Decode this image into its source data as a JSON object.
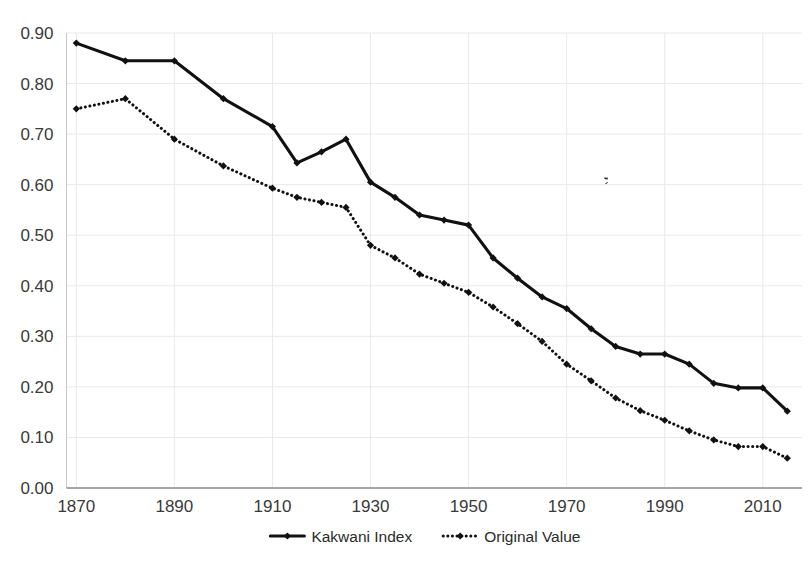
{
  "chart_data": {
    "type": "line",
    "title": "",
    "subtitle": "",
    "xlabel": "",
    "ylabel": "",
    "xlim": [
      1868,
      2018
    ],
    "ylim": [
      0.0,
      0.9
    ],
    "grid": true,
    "legend_position": "bottom-center",
    "x_tick_labels": [
      "1870",
      "1890",
      "1910",
      "1930",
      "1950",
      "1970",
      "1990",
      "2010"
    ],
    "x_ticks": [
      1870,
      1890,
      1910,
      1930,
      1950,
      1970,
      1990,
      2010
    ],
    "y_tick_labels": [
      "0.00",
      "0.10",
      "0.20",
      "0.30",
      "0.40",
      "0.50",
      "0.60",
      "0.70",
      "0.80",
      "0.90"
    ],
    "y_ticks": [
      0.0,
      0.1,
      0.2,
      0.3,
      0.4,
      0.5,
      0.6,
      0.7,
      0.8,
      0.9
    ],
    "x": [
      1870,
      1875,
      1880,
      1885,
      1890,
      1895,
      1900,
      1905,
      1910,
      1915,
      1920,
      1925,
      1930,
      1935,
      1940,
      1945,
      1950,
      1955,
      1960,
      1965,
      1970,
      1975,
      1980,
      1985,
      1990,
      1995,
      2000,
      2005,
      2010,
      2015
    ],
    "series": [
      {
        "name": "Kakwani Index",
        "style": "solid",
        "marker": "diamond",
        "color": "#111111",
        "x": [
          1870,
          1880,
          1890,
          1900,
          1910,
          1915,
          1920,
          1925,
          1930,
          1935,
          1940,
          1945,
          1950,
          1955,
          1960,
          1965,
          1970,
          1975,
          1980,
          1985,
          1990,
          1995,
          2000,
          2005,
          2010,
          2015
        ],
        "values": [
          0.88,
          0.845,
          0.845,
          0.77,
          0.715,
          0.643,
          0.665,
          0.69,
          0.605,
          0.575,
          0.54,
          0.53,
          0.52,
          0.455,
          0.415,
          0.378,
          0.355,
          0.315,
          0.28,
          0.265,
          0.265,
          0.245,
          0.207,
          0.198,
          0.198,
          0.152
        ]
      },
      {
        "name": "Original Value",
        "style": "dotted",
        "marker": "diamond",
        "color": "#111111",
        "x": [
          1870,
          1880,
          1890,
          1900,
          1910,
          1915,
          1920,
          1925,
          1930,
          1935,
          1940,
          1945,
          1950,
          1955,
          1960,
          1965,
          1970,
          1975,
          1980,
          1985,
          1990,
          1995,
          2000,
          2005,
          2010,
          2015
        ],
        "values": [
          0.75,
          0.77,
          0.69,
          0.637,
          0.593,
          0.575,
          0.565,
          0.555,
          0.48,
          0.455,
          0.423,
          0.405,
          0.387,
          0.358,
          0.325,
          0.29,
          0.245,
          0.212,
          0.178,
          0.153,
          0.134,
          0.113,
          0.095,
          0.082,
          0.082,
          0.059
        ]
      }
    ],
    "legend": [
      {
        "label": "Kakwani Index",
        "style": "solid"
      },
      {
        "label": "Original Value",
        "style": "dotted"
      }
    ],
    "annotations": []
  },
  "legend": {
    "kakwani_label": "Kakwani Index",
    "original_label": "Original Value"
  }
}
